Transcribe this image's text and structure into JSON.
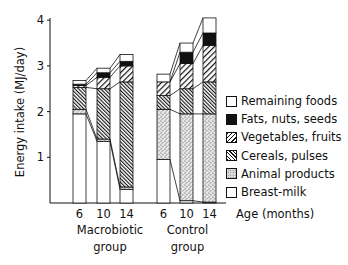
{
  "chart_data": {
    "type": "bar",
    "stacked": true,
    "title": "",
    "ylabel": "Energy intake (MJ/day)",
    "xlabel": "Age (months)",
    "ylim": [
      0,
      4
    ],
    "yticks": [
      1,
      2,
      3,
      4
    ],
    "grid": false,
    "legend_position": "right",
    "groups": [
      {
        "label_line1": "Macrobiotic",
        "label_line2": "group",
        "ages": [
          "6",
          "10",
          "14"
        ]
      },
      {
        "label_line1": "Control",
        "label_line2": "group",
        "ages": [
          "6",
          "10",
          "14"
        ]
      }
    ],
    "categories": [
      "Macrobiotic 6",
      "Macrobiotic 10",
      "Macrobiotic 14",
      "Control 6",
      "Control 10",
      "Control 14"
    ],
    "series": [
      {
        "name": "Breast-milk",
        "pattern": "white",
        "values": [
          1.95,
          1.35,
          0.3,
          0.95,
          0.05,
          0.02
        ]
      },
      {
        "name": "Animal products",
        "pattern": "stipple",
        "values": [
          0.1,
          0.05,
          0.05,
          1.1,
          1.9,
          1.93
        ]
      },
      {
        "name": "Cereals, pulses",
        "pattern": "dense-hatch",
        "values": [
          0.48,
          1.1,
          2.3,
          0.3,
          0.55,
          0.7
        ]
      },
      {
        "name": "Vegetables, fruits",
        "pattern": "hatch",
        "values": [
          0.04,
          0.25,
          0.35,
          0.3,
          0.55,
          0.8
        ]
      },
      {
        "name": "Fats, nuts, seeds",
        "pattern": "black",
        "values": [
          0.03,
          0.1,
          0.1,
          0.0,
          0.25,
          0.27
        ]
      },
      {
        "name": "Remaining foods",
        "pattern": "white",
        "values": [
          0.08,
          0.1,
          0.15,
          0.17,
          0.2,
          0.33
        ]
      }
    ],
    "totals": [
      2.68,
      2.95,
      3.25,
      2.82,
      3.5,
      4.05
    ]
  },
  "labels": {
    "ylabel": "Energy intake (MJ/day)",
    "xlabel": "Age (months)",
    "yticks": [
      "1",
      "2",
      "3",
      "4"
    ],
    "ages": [
      "6",
      "10",
      "14",
      "6",
      "10",
      "14"
    ],
    "group1_line1": "Macrobiotic",
    "group1_line2": "group",
    "group2_line1": "Control",
    "group2_line2": "group"
  },
  "legend": [
    {
      "label": "Remaining foods",
      "swatch": "white"
    },
    {
      "label": "Fats, nuts, seeds",
      "swatch": "black"
    },
    {
      "label": "Vegetables, fruits",
      "swatch": "veg"
    },
    {
      "label": "Cereals, pulses",
      "swatch": "cer"
    },
    {
      "label": "Animal products",
      "swatch": "ani"
    },
    {
      "label": "Breast-milk",
      "swatch": "white"
    }
  ]
}
